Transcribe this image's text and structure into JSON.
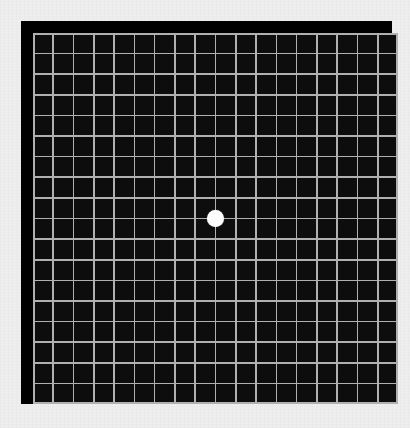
{
  "app": {
    "title": "Amsler Grid",
    "description": "Amsler grid vision test chart with central white fixation dot"
  },
  "chart_data": {
    "type": "grid",
    "xlabel": "",
    "ylabel": "",
    "columns": 18,
    "rows": 18,
    "cell_size_px": 20.3,
    "grid": true,
    "legend": "none",
    "colors": {
      "page_background": "#eeeeee",
      "panel_border": "#000000",
      "cell_fill": "#0d0d0d",
      "grid_line": "#b0b0b0",
      "fixation_dot": "#fdfdfd"
    },
    "grid_origin_px": [
      28,
      27
    ],
    "grid_extent_px": [
      392,
      398
    ],
    "fixation_dot": {
      "label": "central fixation dot",
      "center_px": [
        207,
        214
      ],
      "diameter_px": 17,
      "grid_cell_index": [
        9,
        9
      ]
    }
  }
}
